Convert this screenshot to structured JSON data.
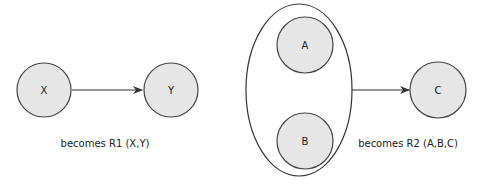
{
  "diagram": {
    "left": {
      "nodes": [
        {
          "id": "X",
          "label": "X"
        },
        {
          "id": "Y",
          "label": "Y"
        }
      ],
      "edge": {
        "from": "X",
        "to": "Y"
      },
      "caption": "becomes R1 (X,Y)"
    },
    "right": {
      "group": {
        "members": [
          "A",
          "B"
        ]
      },
      "nodes": [
        {
          "id": "A",
          "label": "A"
        },
        {
          "id": "B",
          "label": "B"
        },
        {
          "id": "C",
          "label": "C"
        }
      ],
      "edge": {
        "from": "group(A,B)",
        "to": "C"
      },
      "caption": "becomes R2 (A,B,C)"
    },
    "colors": {
      "node_fill": "#e6e6e6",
      "stroke": "#444444",
      "background": "#ffffff"
    }
  }
}
